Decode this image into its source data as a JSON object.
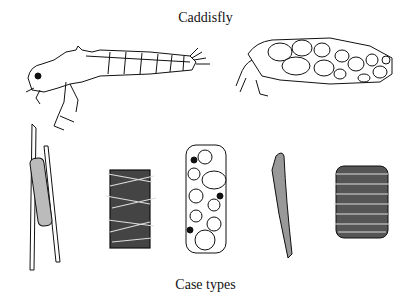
{
  "title": "Caddisfly",
  "caption": "Case types",
  "figures": {
    "larva": {
      "label": "caddisfly-larva"
    },
    "larva_in_case": {
      "label": "caddisfly-larva-in-pebble-case"
    },
    "cases": [
      {
        "label": "stick-attached-tube-case"
      },
      {
        "label": "twig-log-cabin-case"
      },
      {
        "label": "snail-shell-case"
      },
      {
        "label": "sand-grain-tapered-case"
      },
      {
        "label": "leaf-disc-stacked-case"
      }
    ]
  },
  "colors": {
    "ink": "#111111",
    "paper": "#ffffff"
  }
}
